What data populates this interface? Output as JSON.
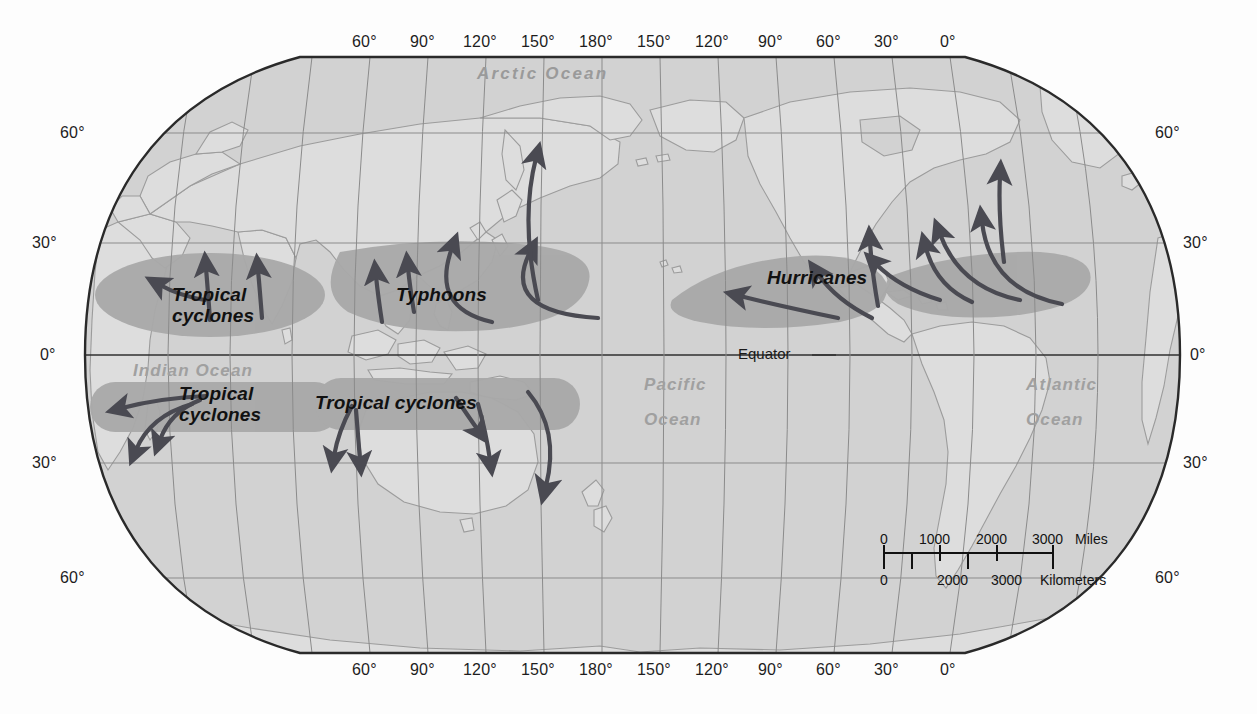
{
  "map": {
    "title": "World map of tropical cyclone regions",
    "projection": "oval / Robinson-like world projection",
    "colors": {
      "ocean": "#d2d2d2",
      "land": "#dcdcdc",
      "storm_zone": "#a9a9a9",
      "graticule": "#8b8b8b",
      "coast": "#9a9a9a",
      "border": "#2a2a2a",
      "arrow": "#4a4a52",
      "ocean_label": "#a0a0a0",
      "storm_label": "#111111"
    }
  },
  "graticule": {
    "longitude_labels_top": [
      "60°",
      "90°",
      "120°",
      "150°",
      "180°",
      "150°",
      "120°",
      "90°",
      "60°",
      "30°",
      "0°"
    ],
    "longitude_labels_bottom": [
      "60°",
      "90°",
      "120°",
      "150°",
      "180°",
      "150°",
      "120°",
      "90°",
      "60°",
      "30°",
      "0°"
    ],
    "latitude_labels_left": [
      "60°",
      "30°",
      "0°",
      "30°",
      "60°"
    ],
    "latitude_labels_right": [
      "60°",
      "30°",
      "0°",
      "30°",
      "60°"
    ],
    "equator_label": "Equator"
  },
  "ocean_labels": [
    {
      "name": "arctic-ocean",
      "text": "Arctic Ocean"
    },
    {
      "name": "indian-ocean",
      "text": "Indian Ocean"
    },
    {
      "name": "pacific-ocean-line1",
      "text": "Pacific"
    },
    {
      "name": "pacific-ocean-line2",
      "text": "Ocean"
    },
    {
      "name": "atlantic-ocean-line1",
      "text": "Atlantic"
    },
    {
      "name": "atlantic-ocean-line2",
      "text": "Ocean"
    }
  ],
  "storm_labels": [
    {
      "name": "north-indian-tropical-cyclones",
      "line1": "Tropical",
      "line2": "cyclones"
    },
    {
      "name": "typhoons",
      "line1": "Typhoons",
      "line2": ""
    },
    {
      "name": "hurricanes",
      "line1": "Hurricanes",
      "line2": ""
    },
    {
      "name": "south-indian-tropical-cyclones",
      "line1": "Tropical",
      "line2": "cyclones"
    },
    {
      "name": "australia-tropical-cyclones",
      "line1": "Tropical cyclones",
      "line2": ""
    }
  ],
  "scale_bar": {
    "miles": {
      "ticks": [
        "0",
        "1000",
        "2000",
        "3000"
      ],
      "unit": "Miles"
    },
    "kilometers": {
      "ticks": [
        "0",
        "2000",
        "3000"
      ],
      "unit": "Kilometers"
    }
  }
}
